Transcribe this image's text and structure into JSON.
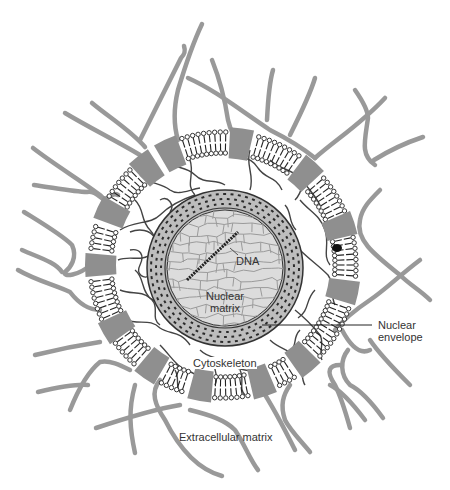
{
  "figure": {
    "type": "schematic diagram of cell structural components",
    "colors": {
      "background": "#ffffff",
      "extracellular_fiber": "#999999",
      "membrane_protein": "#8f8f8f",
      "lipid_line": "#222222",
      "cytoskeleton": "#444444",
      "nucleus_fill": "#d9d9d9",
      "nuclear_matrix": "#9a9a9a",
      "dna": "#222222",
      "label_text": "#333333"
    },
    "geometry": {
      "cell_center": [
        223,
        265
      ],
      "membrane_outer_radius": 135,
      "membrane_inner_radius": 110,
      "nucleus_center": [
        225,
        268
      ],
      "nucleus_outer_radius": 78,
      "nucleus_inner_radius": 58
    }
  },
  "labels": {
    "dna": "DNA",
    "nuclear_matrix_line1": "Nuclear",
    "nuclear_matrix_line2": "matrix",
    "nuclear_envelope_line1": "Nuclear",
    "nuclear_envelope_line2": "envelope",
    "cytoskeleton": "Cytoskeleton",
    "extracellular_matrix": "Extracellular matrix"
  }
}
